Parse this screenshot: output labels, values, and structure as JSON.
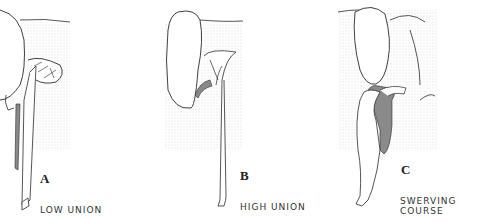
{
  "figure": {
    "panels": [
      {
        "letter": "A",
        "caption": "LOW UNION"
      },
      {
        "letter": "B",
        "caption": "HIGH UNION"
      },
      {
        "letter": "C",
        "caption": "SWERVING COURSE"
      }
    ],
    "colors": {
      "outline": "#2a2a2a",
      "shaded_duct": "#8a8a8a",
      "stipple": "#c8c8c8"
    }
  }
}
